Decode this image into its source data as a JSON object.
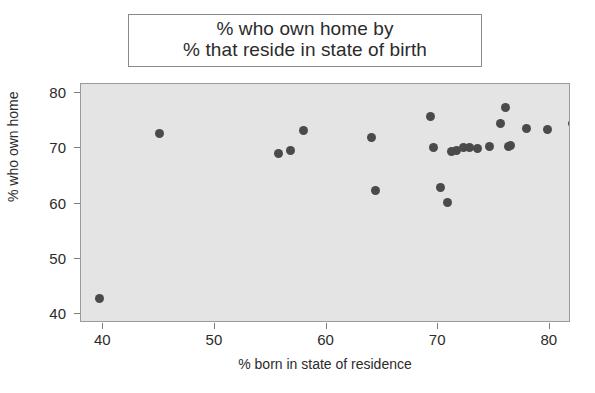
{
  "chart_data": {
    "type": "scatter",
    "title": "% who own home by % that reside in state of birth",
    "title_lines": [
      "% who own home by",
      "% that reside in state of birth"
    ],
    "xlabel": "% born in state of residence",
    "ylabel": "% who own home",
    "xlim": [
      38.0,
      81.9
    ],
    "ylim": [
      38.3,
      81.7
    ],
    "xticks": [
      40,
      50,
      60,
      70,
      80
    ],
    "yticks": [
      40,
      50,
      60,
      70,
      80
    ],
    "xtick_labels": [
      "40",
      "50",
      "60",
      "70",
      "80"
    ],
    "ytick_labels": [
      "40",
      "50",
      "60",
      "70",
      "80"
    ],
    "grid": false,
    "legend": null,
    "marker": "circle",
    "marker_color": "#4a4a4a",
    "marker_size_px": 9,
    "panel_background": "#e4e4e4",
    "figure_background": "#ffffff",
    "x": [
      39.7,
      45.0,
      55.7,
      56.8,
      57.9,
      64.0,
      64.4,
      69.3,
      69.6,
      70.2,
      70.8,
      71.2,
      71.6,
      72.3,
      72.8,
      73.5,
      74.6,
      75.6,
      76.0,
      76.3,
      76.5,
      77.9,
      79.8,
      82.0
    ],
    "y": [
      42.7,
      72.8,
      69.0,
      69.6,
      73.3,
      71.9,
      62.3,
      75.8,
      70.2,
      62.9,
      60.2,
      69.5,
      69.6,
      70.1,
      70.2,
      70.0,
      70.4,
      74.6,
      77.4,
      70.4,
      70.5,
      73.6,
      73.5,
      74.5
    ],
    "points": [
      {
        "x": 39.7,
        "y": 42.7
      },
      {
        "x": 45.0,
        "y": 72.8
      },
      {
        "x": 55.7,
        "y": 69.0
      },
      {
        "x": 56.8,
        "y": 69.6
      },
      {
        "x": 57.9,
        "y": 73.3
      },
      {
        "x": 64.0,
        "y": 71.9
      },
      {
        "x": 64.4,
        "y": 62.3
      },
      {
        "x": 69.3,
        "y": 75.8
      },
      {
        "x": 69.6,
        "y": 70.2
      },
      {
        "x": 70.2,
        "y": 62.9
      },
      {
        "x": 70.8,
        "y": 60.2
      },
      {
        "x": 71.2,
        "y": 69.5
      },
      {
        "x": 71.6,
        "y": 69.6
      },
      {
        "x": 72.3,
        "y": 70.1
      },
      {
        "x": 72.8,
        "y": 70.2
      },
      {
        "x": 73.5,
        "y": 70.0
      },
      {
        "x": 74.6,
        "y": 70.4
      },
      {
        "x": 75.6,
        "y": 74.6
      },
      {
        "x": 76.0,
        "y": 77.4
      },
      {
        "x": 76.3,
        "y": 70.4
      },
      {
        "x": 76.5,
        "y": 70.5
      },
      {
        "x": 77.9,
        "y": 73.6
      },
      {
        "x": 79.8,
        "y": 73.5
      },
      {
        "x": 82.0,
        "y": 74.5
      }
    ]
  }
}
